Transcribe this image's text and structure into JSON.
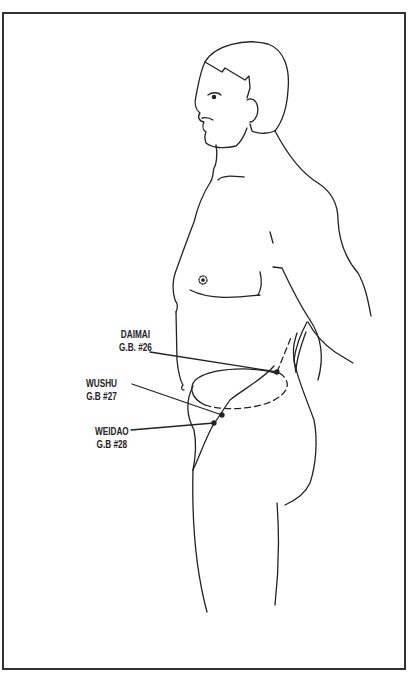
{
  "diagram": {
    "type": "anatomical-illustration",
    "colors": {
      "line": "#222222",
      "background": "#ffffff",
      "frame": "#333333"
    },
    "labels": [
      {
        "name": "DAIMAI",
        "code": "G.B. #26"
      },
      {
        "name": "WUSHU",
        "code": "G.B #27"
      },
      {
        "name": "WEIDAO",
        "code": "G.B #28"
      }
    ]
  }
}
